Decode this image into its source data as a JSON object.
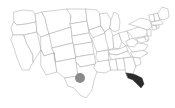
{
  "map": {
    "title": "United States choropleth map",
    "projection": "albers-usa",
    "background_color": "#ffffff",
    "default_state_fill": "#ffffff",
    "state_border_color": "#9a9a9a",
    "state_border_width": 0.45,
    "highlight_fill": "#2b2b2b",
    "marker_fill": "#8a8a8a",
    "width": 175,
    "height": 108,
    "highlighted_states": [
      {
        "code": "FL",
        "name": "Florida",
        "fill": "#2b2b2b"
      }
    ],
    "markers": [
      {
        "name": "texas-marker",
        "shape": "circle",
        "state": "TX",
        "cx": 80,
        "cy": 78,
        "r": 5,
        "fill": "#8a8a8a"
      }
    ],
    "states": [
      {
        "code": "WA",
        "name": "Washington",
        "fill": "#ffffff",
        "d": "M14,12 L23,10 L33,11 L35,14 L36,22 L26,24 L17,25 L14,22 Z"
      },
      {
        "code": "OR",
        "name": "Oregon",
        "fill": "#ffffff",
        "d": "M14,22 L17,25 L26,24 L36,22 L37,32 L24,35 L13,35 L11,28 Z"
      },
      {
        "code": "CA",
        "name": "California",
        "fill": "#ffffff",
        "d": "M13,35 L24,35 L27,44 L33,55 L33,62 L29,70 L22,70 L17,58 L14,48 L11,40 Z"
      },
      {
        "code": "NV",
        "name": "Nevada",
        "fill": "#ffffff",
        "d": "M24,35 L37,32 L41,50 L33,62 L33,55 L27,44 Z"
      },
      {
        "code": "ID",
        "name": "Idaho",
        "fill": "#ffffff",
        "d": "M36,22 L35,14 L42,12 L45,18 L47,27 L49,34 L41,37 L37,32 Z"
      },
      {
        "code": "MT",
        "name": "Montana",
        "fill": "#ffffff",
        "d": "M42,12 L67,9 L70,11 L71,27 L49,34 L47,27 L45,18 Z"
      },
      {
        "code": "WY",
        "name": "Wyoming",
        "fill": "#ffffff",
        "d": "M49,34 L71,27 L73,43 L52,48 Z"
      },
      {
        "code": "UT",
        "name": "Utah",
        "fill": "#ffffff",
        "d": "M41,37 L49,34 L52,48 L54,53 L44,56 L41,50 Z"
      },
      {
        "code": "CO",
        "name": "Colorado",
        "fill": "#ffffff",
        "d": "M52,48 L73,43 L76,58 L55,62 L54,53 Z"
      },
      {
        "code": "AZ",
        "name": "Arizona",
        "fill": "#ffffff",
        "d": "M41,50 L44,56 L54,53 L57,72 L46,75 L41,66 Z"
      },
      {
        "code": "NM",
        "name": "New Mexico",
        "fill": "#ffffff",
        "d": "M54,53 L55,62 L76,58 L78,76 L65,78 L57,72 Z"
      },
      {
        "code": "ND",
        "name": "North Dakota",
        "fill": "#ffffff",
        "d": "M67,9 L86,9 L87,21 L70,24 L71,16 Z"
      },
      {
        "code": "SD",
        "name": "South Dakota",
        "fill": "#ffffff",
        "d": "M70,24 L87,21 L89,33 L72,36 L71,27 Z"
      },
      {
        "code": "NE",
        "name": "Nebraska",
        "fill": "#ffffff",
        "d": "M72,36 L89,33 L92,42 L74,45 L73,43 Z"
      },
      {
        "code": "KS",
        "name": "Kansas",
        "fill": "#ffffff",
        "d": "M74,45 L92,42 L94,54 L76,57 Z"
      },
      {
        "code": "OK",
        "name": "Oklahoma",
        "fill": "#ffffff",
        "d": "M76,57 L94,54 L96,64 L80,67 L76,62 Z"
      },
      {
        "code": "TX",
        "name": "Texas",
        "fill": "#ffffff",
        "d": "M65,78 L78,76 L76,62 L80,67 L96,64 L97,72 L94,80 L92,90 L86,98 L80,95 L74,88 L68,86 Z"
      },
      {
        "code": "MN",
        "name": "Minnesota",
        "fill": "#ffffff",
        "d": "M86,9 L97,10 L100,14 L101,26 L89,30 L87,21 Z"
      },
      {
        "code": "IA",
        "name": "Iowa",
        "fill": "#ffffff",
        "d": "M89,30 L101,26 L105,33 L94,38 L92,36 Z"
      },
      {
        "code": "MO",
        "name": "Missouri",
        "fill": "#ffffff",
        "d": "M92,38 L105,33 L109,40 L108,50 L97,52 L94,45 Z"
      },
      {
        "code": "AR",
        "name": "Arkansas",
        "fill": "#ffffff",
        "d": "M97,52 L108,50 L109,60 L99,62 L96,58 Z"
      },
      {
        "code": "LA",
        "name": "Louisiana",
        "fill": "#ffffff",
        "d": "M96,62 L109,60 L111,70 L105,73 L97,72 L94,68 Z"
      },
      {
        "code": "WI",
        "name": "Wisconsin",
        "fill": "#ffffff",
        "d": "M100,14 L107,13 L111,20 L110,28 L105,32 L101,26 Z"
      },
      {
        "code": "IL",
        "name": "Illinois",
        "fill": "#ffffff",
        "d": "M105,32 L110,28 L113,36 L114,48 L109,50 L106,40 Z"
      },
      {
        "code": "MI",
        "name": "Michigan",
        "fill": "#ffffff",
        "d": "M111,20 L114,12 L118,14 L120,22 L119,30 L114,32 L110,28 Z"
      },
      {
        "code": "IN",
        "name": "Indiana",
        "fill": "#ffffff",
        "d": "M113,36 L119,33 L122,42 L119,49 L114,48 Z"
      },
      {
        "code": "OH",
        "name": "Ohio",
        "fill": "#ffffff",
        "d": "M119,33 L127,31 L130,40 L126,46 L122,42 Z"
      },
      {
        "code": "KY",
        "name": "Kentucky",
        "fill": "#ffffff",
        "d": "M109,50 L119,49 L126,46 L128,51 L117,55 L110,54 Z"
      },
      {
        "code": "TN",
        "name": "Tennessee",
        "fill": "#ffffff",
        "d": "M109,54 L117,55 L128,51 L131,57 L112,60 Z"
      },
      {
        "code": "MS",
        "name": "Mississippi",
        "fill": "#ffffff",
        "d": "M109,60 L116,59 L118,70 L111,70 Z"
      },
      {
        "code": "AL",
        "name": "Alabama",
        "fill": "#ffffff",
        "d": "M116,59 L124,58 L126,70 L118,70 Z"
      },
      {
        "code": "GA",
        "name": "Georgia",
        "fill": "#ffffff",
        "d": "M124,58 L133,57 L136,66 L133,74 L126,73 Z"
      },
      {
        "code": "FL",
        "name": "Florida",
        "fill": "#2b2b2b",
        "d": "M126,73 L133,74 L136,75 L142,78 L144,84 L141,88 L137,84 L133,80 L128,78 Z"
      },
      {
        "code": "SC",
        "name": "South Carolina",
        "fill": "#ffffff",
        "d": "M133,57 L140,58 L141,64 L136,66 Z"
      },
      {
        "code": "NC",
        "name": "North Carolina",
        "fill": "#ffffff",
        "d": "M131,52 L143,50 L148,53 L140,58 L133,57 Z"
      },
      {
        "code": "VA",
        "name": "Virginia",
        "fill": "#ffffff",
        "d": "M128,46 L140,43 L148,45 L145,50 L133,52 Z"
      },
      {
        "code": "WV",
        "name": "West Virginia",
        "fill": "#ffffff",
        "d": "M126,41 L133,38 L138,42 L134,47 L128,46 Z"
      },
      {
        "code": "MD",
        "name": "Maryland",
        "fill": "#ffffff",
        "d": "M136,39 L145,37 L148,41 L141,43 Z"
      },
      {
        "code": "DE",
        "name": "Delaware",
        "fill": "#ffffff",
        "d": "M145,36 L148,36 L149,40 L146,40 Z"
      },
      {
        "code": "PA",
        "name": "Pennsylvania",
        "fill": "#ffffff",
        "d": "M127,31 L139,27 L148,30 L146,36 L134,38 Z"
      },
      {
        "code": "NJ",
        "name": "New Jersey",
        "fill": "#ffffff",
        "d": "M147,30 L151,29 L151,36 L148,36 Z"
      },
      {
        "code": "NY",
        "name": "New York",
        "fill": "#ffffff",
        "d": "M129,24 L141,18 L149,20 L152,26 L148,30 L139,27 Z"
      },
      {
        "code": "CT",
        "name": "Connecticut",
        "fill": "#ffffff",
        "d": "M152,26 L156,25 L157,29 L153,30 Z"
      },
      {
        "code": "RI",
        "name": "Rhode Island",
        "fill": "#ffffff",
        "d": "M156,25 L159,25 L159,28 L157,28 Z"
      },
      {
        "code": "MA",
        "name": "Massachusetts",
        "fill": "#ffffff",
        "d": "M152,22 L161,20 L163,24 L157,25 L152,25 Z"
      },
      {
        "code": "VT",
        "name": "Vermont",
        "fill": "#ffffff",
        "d": "M149,15 L154,14 L155,21 L151,22 Z"
      },
      {
        "code": "NH",
        "name": "New Hampshire",
        "fill": "#ffffff",
        "d": "M154,14 L158,13 L160,20 L155,21 Z"
      },
      {
        "code": "ME",
        "name": "Maine",
        "fill": "#ffffff",
        "d": "M158,13 L162,7 L168,9 L169,17 L164,20 L160,19 Z"
      }
    ]
  }
}
